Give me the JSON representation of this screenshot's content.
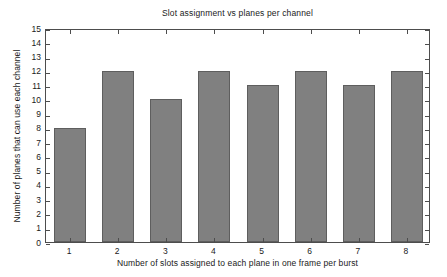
{
  "chart_data": {
    "type": "bar",
    "title": "Slot assignment vs planes per channel",
    "xlabel": "Number of slots assigned to each plane in one frame per burst",
    "ylabel": "Number of planes that can use each channel",
    "categories": [
      "1",
      "2",
      "3",
      "4",
      "5",
      "6",
      "7",
      "8"
    ],
    "values": [
      8,
      12,
      10,
      12,
      11,
      12,
      11,
      12
    ],
    "ylim": [
      0,
      15
    ],
    "yticks": [
      0,
      1,
      2,
      3,
      4,
      5,
      6,
      7,
      8,
      9,
      10,
      11,
      12,
      13,
      14,
      15
    ],
    "ytick_labels": [
      "0",
      "1",
      "2",
      "3",
      "4",
      "5",
      "6",
      "7",
      "8",
      "9",
      "10",
      "11",
      "12",
      "13",
      "14",
      "15"
    ],
    "xtick_labels": [
      "1",
      "2",
      "3",
      "4",
      "5",
      "6",
      "7",
      "8"
    ],
    "grid": false,
    "legend": null,
    "bar_color": "#808080",
    "bar_edge_color": "#5e5e5e",
    "axis_color": "#4d4d4d",
    "background": "#ffffff"
  }
}
